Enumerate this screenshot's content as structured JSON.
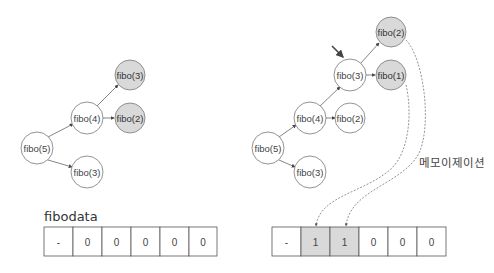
{
  "left": {
    "nodes": [
      {
        "id": "fibo5",
        "label": "fibo(5)",
        "cx": 37,
        "cy": 148,
        "filled": false
      },
      {
        "id": "fibo4",
        "label": "fibo(4)",
        "cx": 87,
        "cy": 118,
        "filled": false
      },
      {
        "id": "fibo3_top",
        "label": "fibo(3)",
        "cx": 130,
        "cy": 75,
        "filled": true
      },
      {
        "id": "fibo2",
        "label": "fibo(2)",
        "cx": 130,
        "cy": 118,
        "filled": true
      },
      {
        "id": "fibo3_bottom",
        "label": "fibo(3)",
        "cx": 87,
        "cy": 172,
        "filled": false
      }
    ],
    "table_label": "fibodata",
    "table": [
      "-",
      "0",
      "0",
      "0",
      "0",
      "0"
    ],
    "table_highlight": [
      false,
      false,
      false,
      false,
      false,
      false
    ]
  },
  "right": {
    "nodes": [
      {
        "id": "fibo5",
        "label": "fibo(5)",
        "cx": 268,
        "cy": 148,
        "filled": false
      },
      {
        "id": "fibo4",
        "label": "fibo(4)",
        "cx": 310,
        "cy": 118,
        "filled": false
      },
      {
        "id": "fibo2_mid",
        "label": "fibo(2)",
        "cx": 350,
        "cy": 118,
        "filled": false
      },
      {
        "id": "fibo3_bottom",
        "label": "fibo(3)",
        "cx": 310,
        "cy": 172,
        "filled": false
      },
      {
        "id": "fibo3",
        "label": "fibo(3)",
        "cx": 350,
        "cy": 75,
        "filled": false
      },
      {
        "id": "fibo2_top",
        "label": "fibo(2)",
        "cx": 391,
        "cy": 32,
        "filled": true
      },
      {
        "id": "fibo1",
        "label": "fibo(1)",
        "cx": 391,
        "cy": 75,
        "filled": true
      }
    ],
    "table": [
      "-",
      "1",
      "1",
      "0",
      "0",
      "0"
    ],
    "table_highlight": [
      false,
      true,
      true,
      false,
      false,
      false
    ],
    "memo_label": "메모이제이션"
  },
  "colors": {
    "node_fill": "#ffffff",
    "node_filled": "#d9d9d9",
    "stroke": "#777777",
    "text": "#444444"
  }
}
